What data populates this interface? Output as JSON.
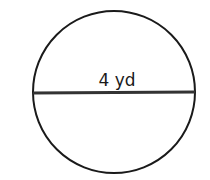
{
  "figure": {
    "shape": "circle",
    "diameter_label": "4 yd",
    "stroke_color": "#1a1a1a",
    "diameter_line_color": "#333333",
    "background": "#ffffff"
  }
}
